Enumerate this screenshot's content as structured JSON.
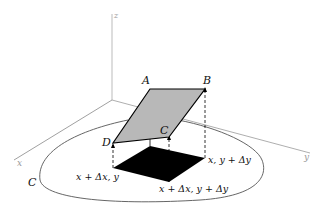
{
  "figure": {
    "axes": {
      "z": "z",
      "x": "x",
      "y": "y"
    },
    "region_label": "C",
    "vertices": {
      "A": "A",
      "B": "B",
      "C": "C",
      "D": "D"
    },
    "base_labels": {
      "corner_left": "x + Δx, y",
      "corner_right": "x, y + Δy",
      "corner_front": "x + Δx, y + Δy"
    },
    "colors": {
      "surface_patch": "#b8b8b8",
      "base_patch": "#000000",
      "axis": "#aaaaaa",
      "curve": "#555555"
    }
  }
}
